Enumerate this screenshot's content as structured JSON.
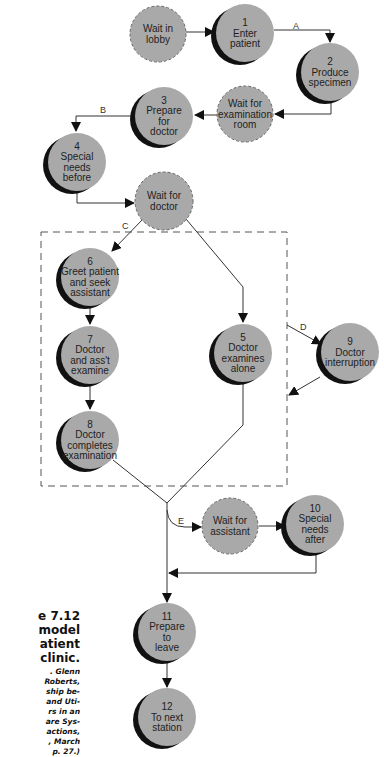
{
  "colors": {
    "node_fill": "#a9a9a9",
    "shadow": "#111111",
    "line": "#333333",
    "dashed_box": "#555555"
  },
  "nodes": [
    {
      "id": "wait-lobby",
      "num": "",
      "lines": [
        "Wait in",
        "lobby"
      ],
      "type": "wait",
      "cx": 158,
      "cy": 34,
      "r": 28
    },
    {
      "id": "n1",
      "num": "1",
      "lines": [
        "Enter",
        "patient"
      ],
      "type": "activity",
      "cx": 245,
      "cy": 33,
      "r": 29
    },
    {
      "id": "n2",
      "num": "2",
      "lines": [
        "Produce",
        "specimen"
      ],
      "type": "activity",
      "cx": 330,
      "cy": 72,
      "r": 29
    },
    {
      "id": "wait-exam",
      "num": "",
      "lines": [
        "Wait for",
        "examination",
        "room"
      ],
      "type": "wait",
      "cx": 245,
      "cy": 114,
      "r": 28
    },
    {
      "id": "n3",
      "num": "3",
      "lines": [
        "Prepare",
        "for",
        "doctor"
      ],
      "type": "activity",
      "cx": 164,
      "cy": 116,
      "r": 29
    },
    {
      "id": "n4",
      "num": "4",
      "lines": [
        "Special",
        "needs",
        "before"
      ],
      "type": "activity",
      "cx": 77,
      "cy": 162,
      "r": 29
    },
    {
      "id": "wait-doctor",
      "num": "",
      "lines": [
        "Wait for",
        "doctor"
      ],
      "type": "wait",
      "cx": 164,
      "cy": 201,
      "r": 29
    },
    {
      "id": "n6",
      "num": "6",
      "lines": [
        "Greet patient",
        "and seek",
        "assistant"
      ],
      "type": "activity",
      "cx": 90,
      "cy": 277,
      "r": 29
    },
    {
      "id": "n7",
      "num": "7",
      "lines": [
        "Doctor",
        "and ass't",
        "examine"
      ],
      "type": "activity",
      "cx": 90,
      "cy": 355,
      "r": 29
    },
    {
      "id": "n5",
      "num": "5",
      "lines": [
        "Doctor",
        "examines",
        "alone"
      ],
      "type": "activity",
      "cx": 243,
      "cy": 353,
      "r": 29
    },
    {
      "id": "n9",
      "num": "9",
      "lines": [
        "Doctor",
        "interruption"
      ],
      "type": "activity",
      "cx": 350,
      "cy": 352,
      "r": 29
    },
    {
      "id": "n8",
      "num": "8",
      "lines": [
        "Doctor",
        "completes",
        "examination"
      ],
      "type": "activity",
      "cx": 90,
      "cy": 440,
      "r": 29
    },
    {
      "id": "wait-assistant",
      "num": "",
      "lines": [
        "Wait for",
        "assistant"
      ],
      "type": "wait",
      "cx": 230,
      "cy": 526,
      "r": 28
    },
    {
      "id": "n10",
      "num": "10",
      "lines": [
        "Special",
        "needs",
        "after"
      ],
      "type": "activity",
      "cx": 315,
      "cy": 524,
      "r": 29
    },
    {
      "id": "n11",
      "num": "11",
      "lines": [
        "Prepare",
        "to",
        "leave"
      ],
      "type": "activity",
      "cx": 167,
      "cy": 632,
      "r": 29
    },
    {
      "id": "n12",
      "num": "12",
      "lines": [
        "To next",
        "station"
      ],
      "type": "activity",
      "cx": 167,
      "cy": 717,
      "r": 29
    }
  ],
  "edge_labels": [
    {
      "text": "A",
      "x": 293,
      "y": 29
    },
    {
      "text": "B",
      "x": 100,
      "y": 113
    },
    {
      "text": "C",
      "x": 122,
      "y": 229
    },
    {
      "text": "D",
      "x": 300,
      "y": 330
    },
    {
      "text": "E",
      "x": 178,
      "y": 524
    }
  ],
  "caption": {
    "title_lines": [
      "e 7.12",
      "model",
      "atient",
      "clinic."
    ],
    "cite_lines": [
      ". Glenn",
      "Roberts,",
      "ship be-",
      "and Uti-",
      "rs in an",
      "are Sys-",
      "actions,",
      ", March",
      "p. 27.)"
    ]
  }
}
